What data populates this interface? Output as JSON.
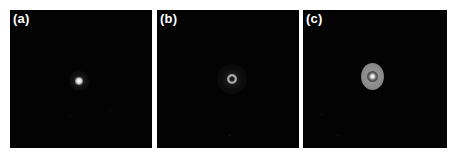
{
  "figure": {
    "panels": [
      {
        "id": "a",
        "label": "(a)",
        "content": "small bright focal spot near center"
      },
      {
        "id": "b",
        "label": "(b)",
        "content": "faint donut-shaped ring spot near center"
      },
      {
        "id": "c",
        "label": "(c)",
        "content": "grey elliptical spot with dark inner ring and bright center"
      }
    ]
  },
  "colors": {
    "background": "#ffffff",
    "panel_fill": "#030303",
    "label": "#ffffff",
    "spot_bright": "#ffffff",
    "spot_grey": "#8c8c8c"
  }
}
